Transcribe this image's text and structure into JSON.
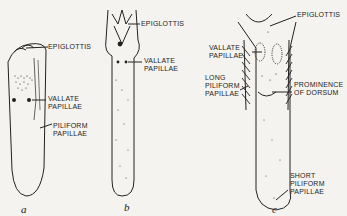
{
  "figure": {
    "panels": [
      {
        "id": "a",
        "caption": "a",
        "labels": {
          "epiglottis": "EPIGLOTTIS",
          "vallate": "VALLATE\nPAPILLAE",
          "piliform": "PILIFORM\nPAPILLAE"
        }
      },
      {
        "id": "b",
        "caption": "b",
        "labels": {
          "epiglottis": "EPIGLOTTIS",
          "vallate": "VALLATE\nPAPILLAE"
        }
      },
      {
        "id": "c",
        "caption": "c",
        "labels": {
          "epiglottis": "EPIGLOTTIS",
          "vallate": "VALLATE\nPAPILLAE",
          "long_piliform": "LONG\nPILIFORM\nPAPILLAE",
          "prominence": "PROMINENCE\nOF DORSUM",
          "short_piliform": "SHORT\nPILIFORM\nPAPILLAE"
        }
      }
    ],
    "colors": {
      "ink": "#222222",
      "paper": "#f4f3ef"
    }
  }
}
